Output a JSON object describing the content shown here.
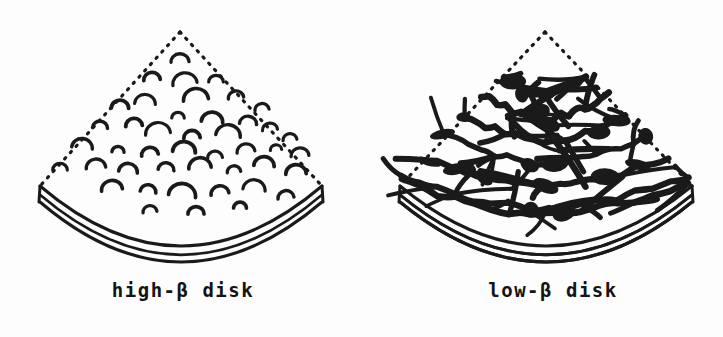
{
  "figure": {
    "background_color": "#fdfdfd",
    "ink_color": "#1a1a1a",
    "width": 723,
    "height": 337
  },
  "panels": [
    {
      "id": "high-beta",
      "caption": "high-β disk",
      "caption_x": 183,
      "caption_y": 279,
      "geometry": {
        "apex_x": 180,
        "apex_y": 32,
        "left_corner_x": 40,
        "left_corner_y": 186,
        "right_corner_x": 322,
        "right_corner_y": 186,
        "arc_sag": 60,
        "edge_thickness": 16,
        "top_edge_style": "dotted",
        "bottom_edge_style": "solid-double-arc"
      },
      "field_style": "small-isolated-loops",
      "loop_count": 44,
      "loops": [
        {
          "x": 180,
          "y": 62,
          "r": 9
        },
        {
          "x": 185,
          "y": 84,
          "r": 13
        },
        {
          "x": 152,
          "y": 80,
          "r": 8
        },
        {
          "x": 216,
          "y": 82,
          "r": 7
        },
        {
          "x": 145,
          "y": 104,
          "r": 11
        },
        {
          "x": 196,
          "y": 100,
          "r": 12
        },
        {
          "x": 236,
          "y": 98,
          "r": 8
        },
        {
          "x": 120,
          "y": 108,
          "r": 9
        },
        {
          "x": 262,
          "y": 110,
          "r": 7
        },
        {
          "x": 178,
          "y": 118,
          "r": 6
        },
        {
          "x": 212,
          "y": 122,
          "r": 11
        },
        {
          "x": 248,
          "y": 124,
          "r": 9
        },
        {
          "x": 100,
          "y": 128,
          "r": 8
        },
        {
          "x": 134,
          "y": 126,
          "r": 8
        },
        {
          "x": 158,
          "y": 134,
          "r": 13
        },
        {
          "x": 192,
          "y": 138,
          "r": 8
        },
        {
          "x": 228,
          "y": 136,
          "r": 12
        },
        {
          "x": 270,
          "y": 130,
          "r": 8
        },
        {
          "x": 290,
          "y": 140,
          "r": 7
        },
        {
          "x": 82,
          "y": 148,
          "r": 11
        },
        {
          "x": 118,
          "y": 152,
          "r": 6
        },
        {
          "x": 150,
          "y": 155,
          "r": 8
        },
        {
          "x": 184,
          "y": 152,
          "r": 12
        },
        {
          "x": 215,
          "y": 158,
          "r": 7
        },
        {
          "x": 246,
          "y": 152,
          "r": 9
        },
        {
          "x": 276,
          "y": 150,
          "r": 6
        },
        {
          "x": 300,
          "y": 156,
          "r": 9
        },
        {
          "x": 60,
          "y": 170,
          "r": 7
        },
        {
          "x": 96,
          "y": 168,
          "r": 10
        },
        {
          "x": 128,
          "y": 172,
          "r": 9
        },
        {
          "x": 166,
          "y": 170,
          "r": 8
        },
        {
          "x": 200,
          "y": 168,
          "r": 12
        },
        {
          "x": 234,
          "y": 172,
          "r": 7
        },
        {
          "x": 264,
          "y": 166,
          "r": 10
        },
        {
          "x": 296,
          "y": 174,
          "r": 11
        },
        {
          "x": 112,
          "y": 190,
          "r": 10
        },
        {
          "x": 148,
          "y": 192,
          "r": 8
        },
        {
          "x": 182,
          "y": 196,
          "r": 13
        },
        {
          "x": 220,
          "y": 194,
          "r": 9
        },
        {
          "x": 254,
          "y": 190,
          "r": 11
        },
        {
          "x": 286,
          "y": 198,
          "r": 8
        },
        {
          "x": 196,
          "y": 214,
          "r": 8
        },
        {
          "x": 150,
          "y": 212,
          "r": 7
        },
        {
          "x": 240,
          "y": 208,
          "r": 6
        }
      ]
    },
    {
      "id": "low-beta",
      "caption": "low-β disk",
      "caption_x": 553,
      "caption_y": 279,
      "geometry": {
        "apex_x": 545,
        "apex_y": 32,
        "left_corner_x": 400,
        "left_corner_y": 186,
        "right_corner_x": 692,
        "right_corner_y": 186,
        "arc_sag": 60,
        "edge_thickness": 16,
        "top_edge_style": "dotted",
        "bottom_edge_style": "solid-double-arc"
      },
      "field_style": "dense-tangled-mesh",
      "mesh": {
        "contour_count": 7,
        "spike_count": 64,
        "node_count": 22,
        "line_weight": 5
      }
    }
  ]
}
